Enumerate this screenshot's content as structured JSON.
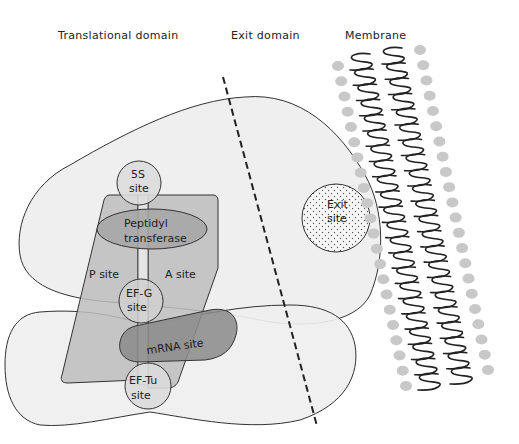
{
  "diagram": {
    "type": "ribosome-domain-schematic",
    "headers": {
      "translational": "Translational domain",
      "exit": "Exit domain",
      "membrane": "Membrane"
    },
    "labels": {
      "five_s_line1": "5S",
      "five_s_line2": "site",
      "peptidyl_line1": "Peptidyl",
      "peptidyl_line2": "transferase",
      "p_site": "P site",
      "a_site": "A site",
      "efg_line1": "EF-G",
      "efg_line2": "site",
      "mrna": "mRNA site",
      "eftu_line1": "EF-Tu",
      "eftu_line2": "site",
      "exit_line1": "Exit",
      "exit_line2": "site"
    },
    "colors": {
      "subunit_fill": "#efefef",
      "site_panel_fill": "#c4c4c4",
      "peptidyl_fill": "#a9a9a9",
      "mrna_fill": "#8a8a8a",
      "circle_fill": "#d8d8d8",
      "outline": "#333333",
      "lipid_head": "#c8c8c8",
      "lipid_tail": "#222222"
    }
  }
}
